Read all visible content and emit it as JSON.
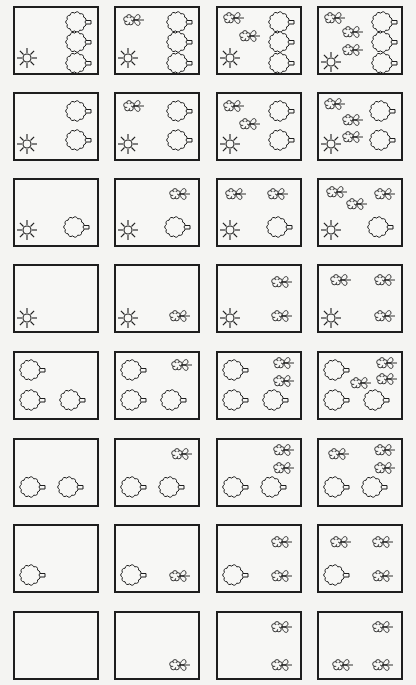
{
  "colors": {
    "stroke": "#1e1e1e",
    "background": "#f4f4f2",
    "box_fill": "#f7f7f5"
  },
  "columns_x": [
    13,
    114,
    216,
    317
  ],
  "rows_y": [
    6,
    92,
    178,
    264,
    351,
    438,
    524,
    611
  ],
  "icon_types": {
    "sun": "sun-icon",
    "tree": "tree-icon",
    "flower": "flower-icon"
  },
  "cells": [
    {
      "row": 0,
      "col": 0,
      "sun": 1,
      "trees": 3,
      "flowers": 0,
      "icons": [
        [
          "sun",
          12,
          50
        ],
        [
          "tree",
          62,
          13
        ],
        [
          "tree",
          62,
          33
        ],
        [
          "tree",
          62,
          54
        ]
      ]
    },
    {
      "row": 0,
      "col": 1,
      "sun": 1,
      "trees": 3,
      "flowers": 1,
      "icons": [
        [
          "sun",
          12,
          50
        ],
        [
          "flower",
          16,
          12
        ],
        [
          "tree",
          62,
          13
        ],
        [
          "tree",
          62,
          33
        ],
        [
          "tree",
          62,
          54
        ]
      ]
    },
    {
      "row": 0,
      "col": 2,
      "sun": 1,
      "trees": 3,
      "flowers": 2,
      "icons": [
        [
          "sun",
          12,
          50
        ],
        [
          "flower",
          14,
          10
        ],
        [
          "flower",
          30,
          28
        ],
        [
          "tree",
          62,
          13
        ],
        [
          "tree",
          62,
          33
        ],
        [
          "tree",
          62,
          54
        ]
      ]
    },
    {
      "row": 0,
      "col": 3,
      "sun": 1,
      "trees": 3,
      "flowers": 3,
      "icons": [
        [
          "sun",
          12,
          54
        ],
        [
          "flower",
          14,
          10
        ],
        [
          "flower",
          32,
          24
        ],
        [
          "flower",
          32,
          42
        ],
        [
          "tree",
          64,
          13
        ],
        [
          "tree",
          64,
          33
        ],
        [
          "tree",
          64,
          54
        ]
      ]
    },
    {
      "row": 1,
      "col": 0,
      "sun": 1,
      "trees": 2,
      "flowers": 0,
      "icons": [
        [
          "sun",
          12,
          50
        ],
        [
          "tree",
          62,
          16
        ],
        [
          "tree",
          62,
          45
        ]
      ]
    },
    {
      "row": 1,
      "col": 1,
      "sun": 1,
      "trees": 2,
      "flowers": 1,
      "icons": [
        [
          "sun",
          12,
          50
        ],
        [
          "flower",
          16,
          12
        ],
        [
          "tree",
          62,
          16
        ],
        [
          "tree",
          62,
          45
        ]
      ]
    },
    {
      "row": 1,
      "col": 2,
      "sun": 1,
      "trees": 2,
      "flowers": 2,
      "icons": [
        [
          "sun",
          12,
          50
        ],
        [
          "flower",
          14,
          12
        ],
        [
          "flower",
          30,
          30
        ],
        [
          "tree",
          62,
          16
        ],
        [
          "tree",
          62,
          45
        ]
      ]
    },
    {
      "row": 1,
      "col": 3,
      "sun": 1,
      "trees": 2,
      "flowers": 3,
      "icons": [
        [
          "sun",
          12,
          50
        ],
        [
          "flower",
          14,
          10
        ],
        [
          "flower",
          32,
          26
        ],
        [
          "flower",
          32,
          43
        ],
        [
          "tree",
          62,
          16
        ],
        [
          "tree",
          62,
          45
        ]
      ]
    },
    {
      "row": 2,
      "col": 0,
      "sun": 1,
      "trees": 1,
      "flowers": 0,
      "icons": [
        [
          "sun",
          12,
          50
        ],
        [
          "tree",
          60,
          46
        ]
      ]
    },
    {
      "row": 2,
      "col": 1,
      "sun": 1,
      "trees": 1,
      "flowers": 1,
      "icons": [
        [
          "sun",
          12,
          50
        ],
        [
          "flower",
          62,
          14
        ],
        [
          "tree",
          60,
          46
        ]
      ]
    },
    {
      "row": 2,
      "col": 2,
      "sun": 1,
      "trees": 1,
      "flowers": 2,
      "icons": [
        [
          "sun",
          12,
          50
        ],
        [
          "flower",
          16,
          14
        ],
        [
          "flower",
          58,
          14
        ],
        [
          "tree",
          60,
          46
        ]
      ]
    },
    {
      "row": 2,
      "col": 3,
      "sun": 1,
      "trees": 1,
      "flowers": 3,
      "icons": [
        [
          "sun",
          12,
          50
        ],
        [
          "flower",
          16,
          12
        ],
        [
          "flower",
          36,
          24
        ],
        [
          "flower",
          64,
          14
        ],
        [
          "tree",
          60,
          46
        ]
      ]
    },
    {
      "row": 3,
      "col": 0,
      "sun": 1,
      "trees": 0,
      "flowers": 0,
      "icons": [
        [
          "sun",
          12,
          52
        ]
      ]
    },
    {
      "row": 3,
      "col": 1,
      "sun": 1,
      "trees": 0,
      "flowers": 1,
      "icons": [
        [
          "sun",
          12,
          52
        ],
        [
          "flower",
          62,
          50
        ]
      ]
    },
    {
      "row": 3,
      "col": 2,
      "sun": 1,
      "trees": 0,
      "flowers": 2,
      "icons": [
        [
          "sun",
          12,
          52
        ],
        [
          "flower",
          62,
          16
        ],
        [
          "flower",
          62,
          50
        ]
      ]
    },
    {
      "row": 3,
      "col": 3,
      "sun": 1,
      "trees": 0,
      "flowers": 3,
      "icons": [
        [
          "sun",
          12,
          52
        ],
        [
          "flower",
          20,
          14
        ],
        [
          "flower",
          64,
          14
        ],
        [
          "flower",
          64,
          50
        ]
      ]
    },
    {
      "row": 4,
      "col": 0,
      "sun": 0,
      "trees": 3,
      "flowers": 0,
      "icons": [
        [
          "tree",
          16,
          16
        ],
        [
          "tree",
          16,
          46
        ],
        [
          "tree",
          56,
          46
        ]
      ]
    },
    {
      "row": 4,
      "col": 1,
      "sun": 0,
      "trees": 3,
      "flowers": 1,
      "icons": [
        [
          "tree",
          16,
          16
        ],
        [
          "tree",
          16,
          46
        ],
        [
          "tree",
          56,
          46
        ],
        [
          "flower",
          64,
          12
        ]
      ]
    },
    {
      "row": 4,
      "col": 2,
      "sun": 0,
      "trees": 3,
      "flowers": 2,
      "icons": [
        [
          "tree",
          16,
          16
        ],
        [
          "tree",
          16,
          46
        ],
        [
          "tree",
          56,
          46
        ],
        [
          "flower",
          64,
          10
        ],
        [
          "flower",
          64,
          28
        ]
      ]
    },
    {
      "row": 4,
      "col": 3,
      "sun": 0,
      "trees": 3,
      "flowers": 3,
      "icons": [
        [
          "tree",
          16,
          16
        ],
        [
          "tree",
          16,
          46
        ],
        [
          "tree",
          56,
          46
        ],
        [
          "flower",
          66,
          10
        ],
        [
          "flower",
          66,
          26
        ],
        [
          "flower",
          40,
          30
        ]
      ]
    },
    {
      "row": 5,
      "col": 0,
      "sun": 0,
      "trees": 2,
      "flowers": 0,
      "icons": [
        [
          "tree",
          16,
          46
        ],
        [
          "tree",
          54,
          46
        ]
      ]
    },
    {
      "row": 5,
      "col": 1,
      "sun": 0,
      "trees": 2,
      "flowers": 1,
      "icons": [
        [
          "tree",
          16,
          46
        ],
        [
          "tree",
          54,
          46
        ],
        [
          "flower",
          64,
          14
        ]
      ]
    },
    {
      "row": 5,
      "col": 2,
      "sun": 0,
      "trees": 2,
      "flowers": 2,
      "icons": [
        [
          "tree",
          16,
          46
        ],
        [
          "tree",
          54,
          46
        ],
        [
          "flower",
          64,
          10
        ],
        [
          "flower",
          64,
          28
        ]
      ]
    },
    {
      "row": 5,
      "col": 3,
      "sun": 0,
      "trees": 2,
      "flowers": 3,
      "icons": [
        [
          "tree",
          16,
          46
        ],
        [
          "tree",
          54,
          46
        ],
        [
          "flower",
          18,
          14
        ],
        [
          "flower",
          64,
          10
        ],
        [
          "flower",
          64,
          28
        ]
      ]
    },
    {
      "row": 6,
      "col": 0,
      "sun": 0,
      "trees": 1,
      "flowers": 0,
      "icons": [
        [
          "tree",
          16,
          48
        ]
      ]
    },
    {
      "row": 6,
      "col": 1,
      "sun": 0,
      "trees": 1,
      "flowers": 1,
      "icons": [
        [
          "tree",
          16,
          48
        ],
        [
          "flower",
          62,
          50
        ]
      ]
    },
    {
      "row": 6,
      "col": 2,
      "sun": 0,
      "trees": 1,
      "flowers": 2,
      "icons": [
        [
          "tree",
          16,
          48
        ],
        [
          "flower",
          62,
          16
        ],
        [
          "flower",
          62,
          50
        ]
      ]
    },
    {
      "row": 6,
      "col": 3,
      "sun": 0,
      "trees": 1,
      "flowers": 3,
      "icons": [
        [
          "tree",
          16,
          48
        ],
        [
          "flower",
          20,
          16
        ],
        [
          "flower",
          62,
          16
        ],
        [
          "flower",
          62,
          50
        ]
      ]
    },
    {
      "row": 7,
      "col": 0,
      "sun": 0,
      "trees": 0,
      "flowers": 0,
      "icons": []
    },
    {
      "row": 7,
      "col": 1,
      "sun": 0,
      "trees": 0,
      "flowers": 1,
      "icons": [
        [
          "flower",
          62,
          52
        ]
      ]
    },
    {
      "row": 7,
      "col": 2,
      "sun": 0,
      "trees": 0,
      "flowers": 2,
      "icons": [
        [
          "flower",
          62,
          14
        ],
        [
          "flower",
          62,
          52
        ]
      ]
    },
    {
      "row": 7,
      "col": 3,
      "sun": 0,
      "trees": 0,
      "flowers": 3,
      "icons": [
        [
          "flower",
          62,
          14
        ],
        [
          "flower",
          22,
          52
        ],
        [
          "flower",
          62,
          52
        ]
      ]
    }
  ]
}
